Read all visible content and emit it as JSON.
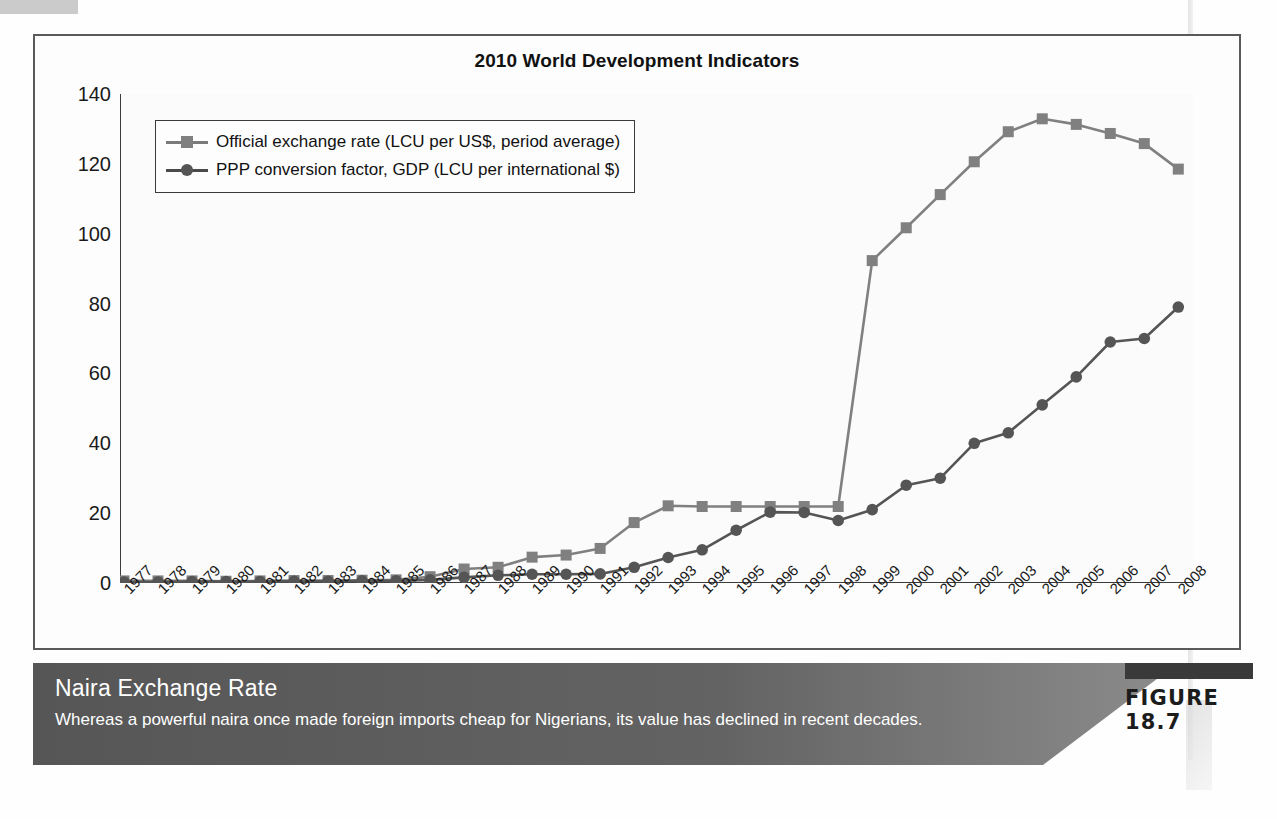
{
  "figure": {
    "tag_label": "FIGURE 18.7",
    "caption_title": "Naira Exchange Rate",
    "caption_body": "Whereas a powerful naira once made foreign imports cheap for Nigerians, its value has declined in recent decades."
  },
  "colors": {
    "series1": "#808080",
    "series2": "#555555",
    "frame": "#5a5a5a",
    "caption_band": "#5e5e5e",
    "figure_bar": "#3a3a3a",
    "text": "#111111"
  },
  "chart_data": {
    "type": "line",
    "title": "2010 World Development Indicators",
    "xlabel": "",
    "ylabel": "",
    "ylim": [
      0,
      140
    ],
    "yticks": [
      0,
      20,
      40,
      60,
      80,
      100,
      120,
      140
    ],
    "grid": false,
    "legend_position": "top-left",
    "categories": [
      "1977",
      "1978",
      "1979",
      "1980",
      "1981",
      "1982",
      "1983",
      "1984",
      "1985",
      "1986",
      "1987",
      "1988",
      "1989",
      "1990",
      "1991",
      "1992",
      "1993",
      "1994",
      "1995",
      "1996",
      "1997",
      "1998",
      "1999",
      "2000",
      "2001",
      "2002",
      "2003",
      "2004",
      "2005",
      "2006",
      "2007",
      "2008"
    ],
    "series": [
      {
        "name": "Official exchange rate (LCU per US$, period average)",
        "marker": "square",
        "color": "#808080",
        "values": [
          0.6,
          0.6,
          0.6,
          0.5,
          0.6,
          0.7,
          0.7,
          0.8,
          0.9,
          1.8,
          4.0,
          4.5,
          7.4,
          8.0,
          9.9,
          17.3,
          22.1,
          21.9,
          21.9,
          21.9,
          21.9,
          21.9,
          92.3,
          101.7,
          111.2,
          120.6,
          129.2,
          132.9,
          131.3,
          128.7,
          125.8,
          118.5
        ]
      },
      {
        "name": "PPP conversion factor, GDP (LCU per international $)",
        "marker": "circle",
        "color": "#555555",
        "values": [
          0.3,
          0.3,
          0.4,
          0.4,
          0.4,
          0.5,
          0.5,
          0.6,
          0.6,
          0.9,
          1.6,
          2.2,
          2.5,
          2.5,
          2.6,
          4.5,
          7.3,
          9.5,
          15.1,
          20.3,
          20.2,
          17.9,
          21.0,
          28.0,
          30.0,
          40.0,
          43.0,
          51.0,
          59.0,
          69.0,
          70.0,
          79.0
        ]
      }
    ]
  },
  "legend": {
    "items": [
      {
        "label": "Official exchange rate (LCU per US$, period average)",
        "marker": "square"
      },
      {
        "label": "PPP conversion factor, GDP (LCU per international $)",
        "marker": "circle"
      }
    ]
  }
}
